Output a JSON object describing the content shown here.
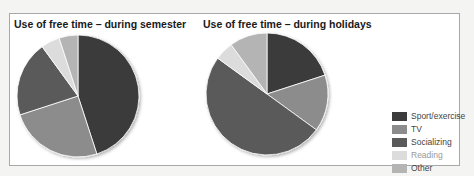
{
  "chart_data": [
    {
      "type": "pie",
      "title": "Use of free time – during semester",
      "categories": [
        "Sport/exercise",
        "TV",
        "Socializing",
        "Reading",
        "Other"
      ],
      "values": [
        45,
        25,
        20,
        5,
        5
      ],
      "colors": [
        "#3b3b3b",
        "#8c8c8c",
        "#5a5a5a",
        "#dcdcdc",
        "#b4b4b4"
      ],
      "start_angle": "12 o'clock, clockwise"
    },
    {
      "type": "pie",
      "title": "Use of free time – during holidays",
      "categories": [
        "Sport/exercise",
        "TV",
        "Socializing",
        "Reading",
        "Other"
      ],
      "values": [
        20,
        15,
        50,
        5,
        10
      ],
      "colors": [
        "#3b3b3b",
        "#8c8c8c",
        "#5a5a5a",
        "#dcdcdc",
        "#b4b4b4"
      ],
      "start_angle": "12 o'clock, clockwise"
    }
  ],
  "charts": {
    "left_title": "Use of free time – during semester",
    "right_title": "Use of free time – during holidays"
  },
  "legend": {
    "position": "right",
    "items": [
      {
        "label": "Sport/exercise",
        "color": "#3b3b3b"
      },
      {
        "label": "TV",
        "color": "#8c8c8c"
      },
      {
        "label": "Socializing",
        "color": "#5a5a5a"
      },
      {
        "label": "Reading",
        "color": "#dcdcdc"
      },
      {
        "label": "Other",
        "color": "#b4b4b4"
      }
    ]
  }
}
